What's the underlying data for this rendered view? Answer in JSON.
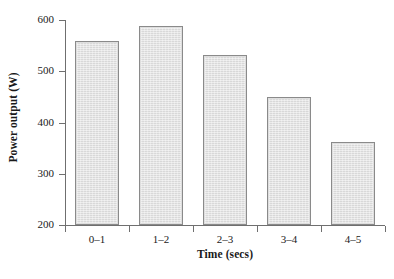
{
  "chart_data": {
    "type": "bar",
    "title": "",
    "categories": [
      "0–1",
      "1–2",
      "2–3",
      "3–4",
      "4–5"
    ],
    "values": [
      560,
      588,
      532,
      450,
      362
    ],
    "xlabel": "Time (secs)",
    "ylabel": "Power output (W)",
    "ylim": [
      200,
      600
    ],
    "yticks": [
      200,
      300,
      400,
      500,
      600
    ],
    "ytick_labels": [
      "200",
      "300",
      "400",
      "500",
      "600"
    ],
    "xlim": [
      0,
      5
    ],
    "grid": false,
    "legend": null,
    "series": [
      {
        "name": "Power output",
        "values": [
          560,
          588,
          532,
          450,
          362
        ]
      }
    ],
    "colors": {
      "bar_fill": "#dedede",
      "bar_edge": "#8a8a8a",
      "axis": "#6f6f6f",
      "text": "#1a1a1a",
      "background": "#ffffff"
    }
  }
}
